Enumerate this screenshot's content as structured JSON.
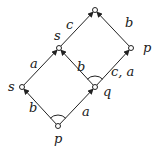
{
  "diagram": {
    "nodes": [
      {
        "id": "top",
        "x": 95,
        "y": 10,
        "label": ""
      },
      {
        "id": "s_mid",
        "x": 59,
        "y": 48,
        "label": "s",
        "lx": 54,
        "ly": 40
      },
      {
        "id": "p_right",
        "x": 131,
        "y": 48,
        "label": "p",
        "lx": 143,
        "ly": 52
      },
      {
        "id": "s_left",
        "x": 22,
        "y": 87,
        "label": "s",
        "lx": 8,
        "ly": 91
      },
      {
        "id": "q",
        "x": 95,
        "y": 87,
        "label": "q",
        "lx": 103,
        "ly": 96
      },
      {
        "id": "p_bottom",
        "x": 58,
        "y": 126,
        "label": "p",
        "lx": 54,
        "ly": 143
      }
    ],
    "edges": [
      {
        "from": "p_bottom",
        "to": "s_left",
        "label": "b",
        "lx": 29,
        "ly": 112
      },
      {
        "from": "p_bottom",
        "to": "q",
        "label": "a",
        "lx": 82,
        "ly": 116
      },
      {
        "from": "s_left",
        "to": "s_mid",
        "label": "a",
        "lx": 30,
        "ly": 68
      },
      {
        "from": "q",
        "to": "s_mid",
        "label": "b",
        "lx": 77,
        "ly": 71
      },
      {
        "from": "q",
        "to": "p_right",
        "label": "c, a",
        "lx": 111,
        "ly": 76
      },
      {
        "from": "s_mid",
        "to": "top",
        "label": "c",
        "lx": 66,
        "ly": 29
      },
      {
        "from": "p_right",
        "to": "top",
        "label": "b",
        "lx": 125,
        "ly": 27
      }
    ],
    "arcs": [
      {
        "at": "p_bottom",
        "label": "arc-bottom"
      },
      {
        "at": "q",
        "label": "arc-q"
      }
    ]
  }
}
